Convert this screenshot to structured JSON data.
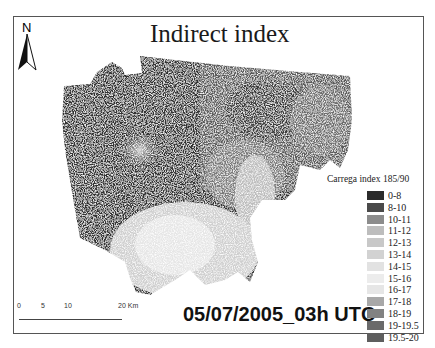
{
  "title": "Indirect index",
  "north_arrow": {
    "label": "N",
    "icon": "north-arrow-icon"
  },
  "timestamp": "05/07/2005_03h UTC",
  "scale_bar": {
    "ticks": [
      "0",
      "5",
      "10",
      "20 Km"
    ]
  },
  "legend": {
    "title": "Carrega index 185/90",
    "items": [
      {
        "label": "0-8",
        "color": "#2b2b2b"
      },
      {
        "label": "8-10",
        "color": "#4a4a4a"
      },
      {
        "label": "10-11",
        "color": "#8c8c8c"
      },
      {
        "label": "11-12",
        "color": "#bdbdbd"
      },
      {
        "label": "12-13",
        "color": "#c8c8c8"
      },
      {
        "label": "13-14",
        "color": "#d2d2d2"
      },
      {
        "label": "14-15",
        "color": "#e2e2e2"
      },
      {
        "label": "15-16",
        "color": "#ececec"
      },
      {
        "label": "16-17",
        "color": "#e6e6e6"
      },
      {
        "label": "17-18",
        "color": "#a8a8a8"
      },
      {
        "label": "18-19",
        "color": "#828282"
      },
      {
        "label": "19-19.5",
        "color": "#6a6a6a"
      },
      {
        "label": "19.5-20",
        "color": "#5e5e5e"
      }
    ]
  }
}
